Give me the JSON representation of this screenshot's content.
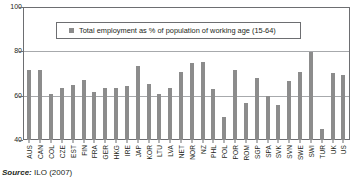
{
  "source": {
    "label": "Source:",
    "value": "ILO (2007)"
  },
  "legend": {
    "swatch_color": "#8c8c8c",
    "text": "Total employment as % of population of working age (15-64)"
  },
  "axis": {
    "y_ticks": [
      "100",
      "80",
      "60",
      "40"
    ]
  },
  "chart_data": {
    "type": "bar",
    "title": "",
    "subtitle": "",
    "xlabel": "",
    "ylabel": "",
    "ylim": [
      40,
      100
    ],
    "yticks": [
      40,
      60,
      80,
      100
    ],
    "grid": true,
    "legend_position": "top-center",
    "bar_color": "#8c8c8c",
    "legend": [
      "Total employment as % of population of working age (15-64)"
    ],
    "categories": [
      "AUS",
      "CAN",
      "COL",
      "CZE",
      "EST",
      "FIN",
      "FRA",
      "GER",
      "HKG",
      "IRE",
      "JAP",
      "KOR",
      "LTU",
      "LVA",
      "NET",
      "NOR",
      "NZ",
      "PHL",
      "POL",
      "POR",
      "ROM",
      "SGP",
      "SPA",
      "SVK",
      "SVN",
      "SWE",
      "SWI",
      "TUR",
      "UK",
      "US"
    ],
    "series": [
      {
        "name": "Total employment as % of population of working age (15-64)",
        "values": [
          72,
          72,
          61,
          63.5,
          65,
          67.5,
          62,
          63.5,
          63.5,
          64.5,
          73.5,
          65.5,
          61,
          63.5,
          71,
          75,
          75.5,
          63,
          50.5,
          72,
          57,
          68,
          60,
          56,
          67,
          71,
          80,
          45,
          70.5,
          69.5
        ]
      }
    ]
  }
}
